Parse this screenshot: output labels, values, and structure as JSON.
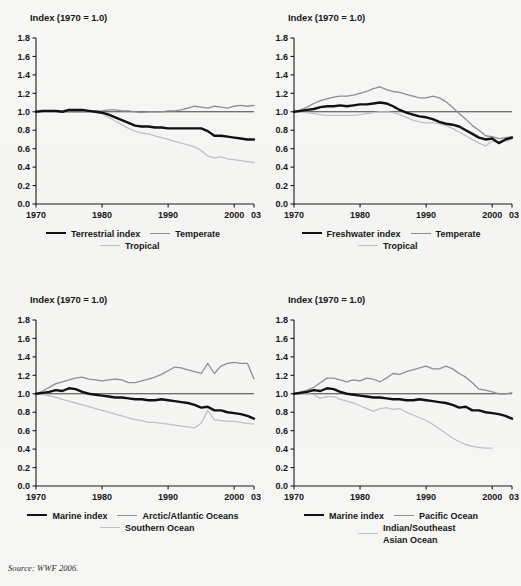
{
  "figure": {
    "background_color": "#f6f6f4",
    "source_note": "Source: WWF 2006."
  },
  "axes_common": {
    "y_axis_title": "Index (1970 = 1.0)",
    "y_ticks": [
      "0.0",
      "0.2",
      "0.4",
      "0.6",
      "0.8",
      "1.0",
      "1.2",
      "1.4",
      "1.6",
      "1.8"
    ],
    "x_ticks": [
      "1970",
      "1980",
      "1990",
      "2000",
      "03"
    ],
    "ylim": [
      0.0,
      1.8
    ],
    "xlim": [
      1970,
      2003
    ],
    "reference_line_value": 1.0,
    "grid": false
  },
  "colors": {
    "main_series": "#111111",
    "series_mid_gray": "#8e8e8e",
    "series_light_gray": "#c0c0c0",
    "axis": "#1a1a1a",
    "background": "#f6f6f4"
  },
  "panels": [
    {
      "id": "terrestrial",
      "position": "top-left",
      "axis_title": "Index (1970 = 1.0)",
      "legend": [
        {
          "label": "Terrestrial index",
          "style": "main"
        },
        {
          "label": "Temperate",
          "style": "mid"
        },
        {
          "label": "Tropical",
          "style": "light"
        }
      ]
    },
    {
      "id": "freshwater",
      "position": "top-right",
      "axis_title": "Index (1970 = 1.0)",
      "legend": [
        {
          "label": "Freshwater index",
          "style": "main"
        },
        {
          "label": "Temperate",
          "style": "mid"
        },
        {
          "label": "Tropical",
          "style": "light"
        }
      ]
    },
    {
      "id": "marine-polar",
      "position": "bottom-left",
      "axis_title": "Index (1970 = 1.0)",
      "legend": [
        {
          "label": "Marine index",
          "style": "main"
        },
        {
          "label": "Arctic/Atlantic Oceans",
          "style": "mid"
        },
        {
          "label": "Southern Ocean",
          "style": "light"
        }
      ]
    },
    {
      "id": "marine-pacific",
      "position": "bottom-right",
      "axis_title": "Index (1970 = 1.0)",
      "legend": [
        {
          "label": "Marine index",
          "style": "main"
        },
        {
          "label": "Pacific Ocean",
          "style": "mid"
        },
        {
          "label": "Indian/Southeast Asian Ocean",
          "style": "light"
        }
      ]
    }
  ],
  "chart_data": [
    {
      "id": "terrestrial",
      "type": "line",
      "title": "",
      "xlabel": "",
      "ylabel": "Index (1970 = 1.0)",
      "xlim": [
        1970,
        2003
      ],
      "ylim": [
        0.0,
        1.8
      ],
      "grid": false,
      "legend_position": "bottom",
      "x": [
        1970,
        1971,
        1972,
        1973,
        1974,
        1975,
        1976,
        1977,
        1978,
        1979,
        1980,
        1981,
        1982,
        1983,
        1984,
        1985,
        1986,
        1987,
        1988,
        1989,
        1990,
        1991,
        1992,
        1993,
        1994,
        1995,
        1996,
        1997,
        1998,
        1999,
        2000,
        2001,
        2002,
        2003
      ],
      "series": [
        {
          "name": "Terrestrial index",
          "color": "#111111",
          "values": [
            1.0,
            1.01,
            1.01,
            1.01,
            1.0,
            1.02,
            1.02,
            1.02,
            1.01,
            1.0,
            0.99,
            0.97,
            0.94,
            0.91,
            0.88,
            0.85,
            0.84,
            0.84,
            0.83,
            0.83,
            0.82,
            0.82,
            0.82,
            0.82,
            0.82,
            0.82,
            0.79,
            0.74,
            0.74,
            0.73,
            0.72,
            0.71,
            0.7,
            0.7
          ]
        },
        {
          "name": "Temperate",
          "color": "#8e8e8e",
          "values": [
            1.0,
            1.0,
            1.0,
            1.0,
            1.0,
            1.0,
            1.0,
            1.0,
            1.0,
            1.01,
            1.01,
            1.02,
            1.02,
            1.01,
            1.01,
            1.0,
            0.99,
            1.0,
            1.0,
            1.0,
            1.01,
            1.01,
            1.02,
            1.04,
            1.06,
            1.05,
            1.04,
            1.06,
            1.05,
            1.04,
            1.06,
            1.07,
            1.06,
            1.07
          ]
        },
        {
          "name": "Tropical",
          "color": "#c0c0c0",
          "values": [
            1.0,
            1.01,
            1.01,
            1.01,
            1.0,
            1.02,
            1.02,
            1.02,
            1.01,
            1.0,
            0.98,
            0.94,
            0.9,
            0.86,
            0.82,
            0.79,
            0.77,
            0.76,
            0.74,
            0.72,
            0.7,
            0.68,
            0.66,
            0.64,
            0.62,
            0.58,
            0.52,
            0.5,
            0.51,
            0.49,
            0.48,
            0.47,
            0.46,
            0.45
          ]
        }
      ]
    },
    {
      "id": "freshwater",
      "type": "line",
      "title": "",
      "xlabel": "",
      "ylabel": "Index (1970 = 1.0)",
      "xlim": [
        1970,
        2003
      ],
      "ylim": [
        0.0,
        1.8
      ],
      "grid": false,
      "legend_position": "bottom",
      "x": [
        1970,
        1971,
        1972,
        1973,
        1974,
        1975,
        1976,
        1977,
        1978,
        1979,
        1980,
        1981,
        1982,
        1983,
        1984,
        1985,
        1986,
        1987,
        1988,
        1989,
        1990,
        1991,
        1992,
        1993,
        1994,
        1995,
        1996,
        1997,
        1998,
        1999,
        2000,
        2001,
        2002,
        2003
      ],
      "series": [
        {
          "name": "Freshwater index",
          "color": "#111111",
          "values": [
            1.0,
            1.01,
            1.02,
            1.03,
            1.05,
            1.06,
            1.06,
            1.07,
            1.06,
            1.07,
            1.08,
            1.08,
            1.09,
            1.1,
            1.09,
            1.06,
            1.02,
            0.99,
            0.97,
            0.95,
            0.94,
            0.92,
            0.89,
            0.87,
            0.86,
            0.84,
            0.8,
            0.76,
            0.72,
            0.7,
            0.71,
            0.66,
            0.7,
            0.72
          ]
        },
        {
          "name": "Temperate",
          "color": "#8e8e8e",
          "values": [
            1.0,
            1.02,
            1.05,
            1.09,
            1.12,
            1.14,
            1.16,
            1.17,
            1.17,
            1.18,
            1.2,
            1.22,
            1.25,
            1.27,
            1.24,
            1.22,
            1.21,
            1.19,
            1.17,
            1.15,
            1.15,
            1.17,
            1.15,
            1.11,
            1.05,
            0.98,
            0.92,
            0.85,
            0.8,
            0.74,
            0.73,
            0.71,
            0.72,
            0.73
          ]
        },
        {
          "name": "Tropical",
          "color": "#c0c0c0",
          "values": [
            1.0,
            1.0,
            0.99,
            0.98,
            0.97,
            0.96,
            0.96,
            0.96,
            0.96,
            0.96,
            0.97,
            0.98,
            0.99,
            1.0,
            1.0,
            0.99,
            0.97,
            0.94,
            0.91,
            0.89,
            0.88,
            0.88,
            0.87,
            0.85,
            0.82,
            0.78,
            0.74,
            0.7,
            0.66,
            0.63,
            0.68,
            0.67,
            0.68,
            0.7
          ]
        }
      ]
    },
    {
      "id": "marine-polar",
      "type": "line",
      "title": "",
      "xlabel": "",
      "ylabel": "Index (1970 = 1.0)",
      "xlim": [
        1970,
        2003
      ],
      "ylim": [
        0.0,
        1.8
      ],
      "grid": false,
      "legend_position": "bottom",
      "x": [
        1970,
        1971,
        1972,
        1973,
        1974,
        1975,
        1976,
        1977,
        1978,
        1979,
        1980,
        1981,
        1982,
        1983,
        1984,
        1985,
        1986,
        1987,
        1988,
        1989,
        1990,
        1991,
        1992,
        1993,
        1994,
        1995,
        1996,
        1997,
        1998,
        1999,
        2000,
        2001,
        2002,
        2003
      ],
      "series": [
        {
          "name": "Marine index",
          "color": "#111111",
          "values": [
            1.0,
            1.01,
            1.02,
            1.04,
            1.03,
            1.06,
            1.05,
            1.02,
            1.0,
            0.99,
            0.98,
            0.97,
            0.96,
            0.96,
            0.95,
            0.94,
            0.94,
            0.93,
            0.93,
            0.94,
            0.93,
            0.92,
            0.91,
            0.9,
            0.88,
            0.85,
            0.86,
            0.82,
            0.82,
            0.8,
            0.79,
            0.78,
            0.76,
            0.73
          ]
        },
        {
          "name": "Arctic/Atlantic Oceans",
          "color": "#8e8e8e",
          "values": [
            1.0,
            1.03,
            1.07,
            1.11,
            1.13,
            1.15,
            1.17,
            1.18,
            1.16,
            1.15,
            1.14,
            1.15,
            1.16,
            1.15,
            1.12,
            1.12,
            1.14,
            1.16,
            1.18,
            1.21,
            1.25,
            1.29,
            1.28,
            1.26,
            1.24,
            1.22,
            1.33,
            1.22,
            1.3,
            1.33,
            1.34,
            1.33,
            1.33,
            1.16
          ]
        },
        {
          "name": "Southern Ocean",
          "color": "#c0c0c0",
          "values": [
            1.0,
            0.99,
            0.98,
            0.96,
            0.94,
            0.92,
            0.9,
            0.88,
            0.86,
            0.84,
            0.82,
            0.8,
            0.78,
            0.76,
            0.74,
            0.72,
            0.71,
            0.69,
            0.69,
            0.68,
            0.67,
            0.66,
            0.65,
            0.64,
            0.63,
            0.68,
            0.82,
            0.72,
            0.71,
            0.7,
            0.7,
            0.69,
            0.68,
            0.67
          ]
        }
      ]
    },
    {
      "id": "marine-pacific",
      "type": "line",
      "title": "",
      "xlabel": "",
      "ylabel": "Index (1970 = 1.0)",
      "xlim": [
        1970,
        2003
      ],
      "ylim": [
        0.0,
        1.8
      ],
      "grid": false,
      "legend_position": "bottom",
      "x": [
        1970,
        1971,
        1972,
        1973,
        1974,
        1975,
        1976,
        1977,
        1978,
        1979,
        1980,
        1981,
        1982,
        1983,
        1984,
        1985,
        1986,
        1987,
        1988,
        1989,
        1990,
        1991,
        1992,
        1993,
        1994,
        1995,
        1996,
        1997,
        1998,
        1999,
        2000,
        2001,
        2002,
        2003
      ],
      "series": [
        {
          "name": "Marine index",
          "color": "#111111",
          "values": [
            1.0,
            1.01,
            1.02,
            1.04,
            1.03,
            1.06,
            1.05,
            1.02,
            1.0,
            0.99,
            0.98,
            0.97,
            0.96,
            0.96,
            0.95,
            0.94,
            0.94,
            0.93,
            0.93,
            0.94,
            0.93,
            0.92,
            0.91,
            0.9,
            0.88,
            0.85,
            0.86,
            0.82,
            0.82,
            0.8,
            0.79,
            0.78,
            0.76,
            0.73
          ]
        },
        {
          "name": "Pacific Ocean",
          "color": "#8e8e8e",
          "values": [
            1.0,
            1.02,
            1.04,
            1.07,
            1.12,
            1.17,
            1.17,
            1.15,
            1.13,
            1.15,
            1.14,
            1.17,
            1.16,
            1.13,
            1.17,
            1.22,
            1.21,
            1.24,
            1.26,
            1.28,
            1.3,
            1.27,
            1.27,
            1.3,
            1.27,
            1.22,
            1.18,
            1.12,
            1.05,
            1.04,
            1.02,
            1.0,
            1.0,
            1.01
          ]
        },
        {
          "name": "Indian/Southeast Asian Ocean",
          "color": "#c0c0c0",
          "values": [
            1.0,
            1.0,
            1.0,
            0.99,
            0.95,
            0.97,
            0.97,
            0.94,
            0.92,
            0.9,
            0.87,
            0.84,
            0.81,
            0.84,
            0.85,
            0.83,
            0.84,
            0.8,
            0.77,
            0.74,
            0.71,
            0.67,
            0.62,
            0.57,
            0.52,
            0.48,
            0.45,
            0.43,
            0.42,
            0.41,
            0.41,
            null,
            null,
            null
          ]
        }
      ]
    }
  ]
}
